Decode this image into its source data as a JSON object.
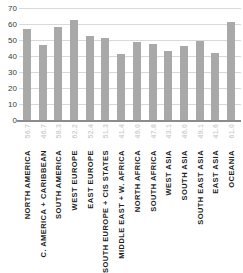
{
  "chart_data": {
    "type": "bar",
    "title": "",
    "subtitle": "",
    "xlabel": "",
    "ylabel": "",
    "ylim": [
      0,
      70
    ],
    "yticks": [
      0,
      10,
      20,
      30,
      40,
      50,
      60,
      70
    ],
    "ytick_labels": [
      "0",
      "10",
      "20",
      "30",
      "40",
      "50",
      "60",
      "70"
    ],
    "grid": true,
    "legend": "none",
    "orientation": "vertical",
    "bar_color": "#a9a9a9",
    "gridline_color": "#d9d9d9",
    "axis_color": "#8c8c8c",
    "value_label_color": "#d2d2d2",
    "category_label_color": "#1c1c1c",
    "categories": [
      "NORTH AMERICA",
      "C. AMERICA + CARIBBEAN",
      "SOUTH AMERICA",
      "WEST EUROPE",
      "EAST EUROPE",
      "SOUTH EUROPE + CIS STATES",
      "MIDDLE EAST + W. AFRICA",
      "NORTH AFRICA",
      "SOUTH AFRICA",
      "WEST ASIA",
      "SOUTH ASIA",
      "SOUTH EAST ASIA",
      "EAST ASIA",
      "OCEANIA"
    ],
    "values": [
      56.7,
      46.7,
      58.3,
      62.2,
      52.4,
      51.3,
      41.4,
      49.0,
      47.8,
      43.1,
      46.0,
      49.1,
      41.6,
      61.0
    ],
    "value_labels": [
      "56.7",
      "46.7",
      "58.3",
      "62.2",
      "52.4",
      "51.3",
      "41.4",
      "49.0",
      "47.8",
      "43.1",
      "46.0",
      "49.1",
      "41.6",
      "61.0"
    ]
  }
}
